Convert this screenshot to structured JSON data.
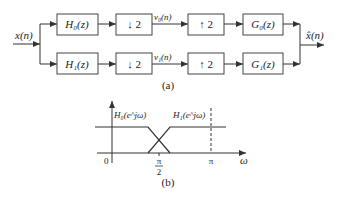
{
  "diagram_a": {
    "caption": "(a)",
    "input_label": "x(n)",
    "output_label": "x̂(n)",
    "top_branch": {
      "analysis_filter": "H₀(z)",
      "downsample": "↓ 2",
      "signal": "v₀(n)",
      "upsample": "↑ 2",
      "synthesis_filter": "G₀(z)"
    },
    "bottom_branch": {
      "analysis_filter": "H₁(z)",
      "downsample": "↓ 2",
      "signal": "v₁(n)",
      "upsample": "↑ 2",
      "synthesis_filter": "G₁(z)"
    }
  },
  "diagram_b": {
    "caption": "(b)",
    "h0_label": "H₀(e^jω)",
    "h1_label": "H₁(e^jω)",
    "origin_label": "0",
    "pi_half_num": "π",
    "pi_half_den": "2",
    "pi_label": "π",
    "axis_label": "ω"
  }
}
